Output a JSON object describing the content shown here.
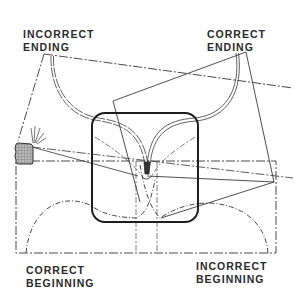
{
  "diagram": {
    "labels": {
      "incorrect_ending": [
        "INCORRECT",
        "ENDING"
      ],
      "correct_ending": [
        "CORRECT",
        "ENDING"
      ],
      "correct_beginning": [
        "CORRECT",
        "BEGINNING"
      ],
      "incorrect_beginning": [
        "INCORRECT",
        "BEGINNING"
      ]
    },
    "elements": [
      "rounded-square-center",
      "bottom-dashed-rectangle",
      "incorrect-ending-tilted-rectangle",
      "correct-ending-tilted-rectangle",
      "double-line-curve-left",
      "double-line-curve-right",
      "dashed-arc-bottom-left",
      "dashed-arc-bottom-right",
      "hatched-block-left",
      "radiating-marks"
    ],
    "colors": {
      "line": "#3a3a3a",
      "bold_line": "#1e1e1e",
      "hatch_fill": "#9a9a9a",
      "background": "#ffffff"
    }
  }
}
